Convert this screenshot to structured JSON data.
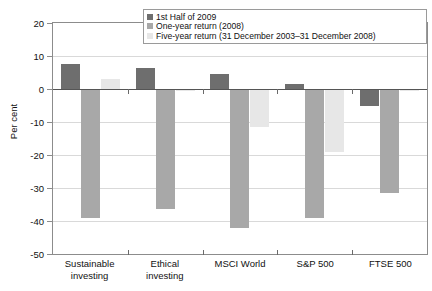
{
  "chart_data": {
    "type": "bar",
    "title": "",
    "xlabel": "",
    "ylabel": "Per cent",
    "ylim": [
      -50,
      20
    ],
    "yticks": [
      20,
      10,
      0,
      -10,
      -20,
      -30,
      -40,
      -50
    ],
    "ytick_labels": [
      "20",
      "10",
      "0",
      "-10",
      "-20",
      "-30",
      "-40",
      "-50"
    ],
    "grid": true,
    "legend_position": "top",
    "categories": [
      "Sustainable investing",
      "Ethical investing",
      "MSCI World",
      "S&P 500",
      "FTSE 500"
    ],
    "category_lines": [
      [
        "Sustainable",
        "investing"
      ],
      [
        "Ethical",
        "investing"
      ],
      [
        "MSCI World",
        ""
      ],
      [
        "S&P 500",
        ""
      ],
      [
        "FTSE 500",
        ""
      ]
    ],
    "series": [
      {
        "name": "1st Half of 2009",
        "color": "#6e6e6e",
        "values": [
          7.5,
          6.5,
          4.5,
          1.5,
          -5.0
        ]
      },
      {
        "name": "One-year return (2008)",
        "color": "#a8a8a8",
        "values": [
          -39.0,
          -36.5,
          -42.0,
          -39.0,
          -31.5
        ]
      },
      {
        "name": "Five-year return (31 December 2003–31 December 2008)",
        "color": "#e7e7e7",
        "values": [
          3.0,
          -0.5,
          -11.5,
          -19.0,
          -0.5
        ]
      }
    ]
  },
  "legend": {
    "items": [
      "1st Half of 2009",
      "One-year return (2008)",
      "Five-year return (31 December 2003–31 December 2008)"
    ]
  },
  "colors": {
    "series_1": "#6e6e6e",
    "series_2": "#a8a8a8",
    "series_3": "#e7e7e7",
    "axis": "#8c8c8c",
    "grid": "#d9d9d9",
    "zero_line": "#555555",
    "text": "#111111"
  }
}
